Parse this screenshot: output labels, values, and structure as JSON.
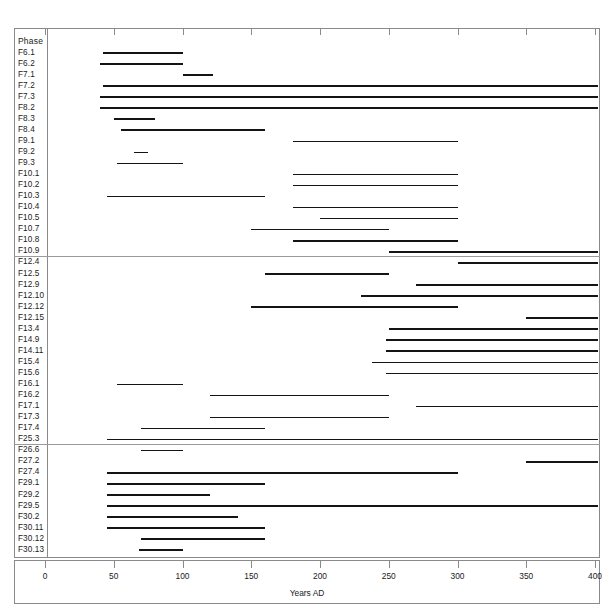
{
  "header": {
    "column_title": "Phase",
    "corner_note": ""
  },
  "axis": {
    "label": "Years AD",
    "ticks": [
      0,
      50,
      100,
      150,
      200,
      250,
      300,
      350,
      400
    ],
    "min": 0,
    "max": 400
  },
  "chart_data": {
    "type": "bar",
    "title": "",
    "xlabel": "Years AD",
    "ylabel": "Phase",
    "xlim": [
      0,
      400
    ],
    "grid": false,
    "legend": "none",
    "orientation": "horizontal-range",
    "note": "Horizontal span (Gantt-style) chart: each phase is a date range in Years AD.",
    "categories": [
      "F6.1",
      "F6.2",
      "F7.1",
      "F7.2",
      "F7.3",
      "F8.2",
      "F8.3",
      "F8.4",
      "F9.1",
      "F9.2",
      "F9.3",
      "F10.1",
      "F10.2",
      "F10.3",
      "F10.4",
      "F10.5",
      "F10.7",
      "F10.8",
      "F10.9",
      "F12.4",
      "F12.5",
      "F12.9",
      "F12.10",
      "F12.12",
      "F12.15",
      "F13.4",
      "F14.9",
      "F14.11",
      "F15.4",
      "F15.6",
      "F16.1",
      "F16.2",
      "F17.1",
      "F17.3",
      "F17.4",
      "F25.3",
      "F26.6",
      "F27.2",
      "F27.4",
      "F29.1",
      "F29.2",
      "F29.5",
      "F30.2",
      "F30.11",
      "F30.12",
      "F30.13"
    ],
    "ranges": [
      {
        "phase": "F6.1",
        "start": 42,
        "end": 100,
        "group": 1
      },
      {
        "phase": "F6.2",
        "start": 40,
        "end": 100,
        "group": 1
      },
      {
        "phase": "F7.1",
        "start": 100,
        "end": 122,
        "group": 1
      },
      {
        "phase": "F7.2",
        "start": 42,
        "end": 400,
        "group": 1
      },
      {
        "phase": "F7.3",
        "start": 40,
        "end": 400,
        "group": 1
      },
      {
        "phase": "F8.2",
        "start": 40,
        "end": 400,
        "group": 1
      },
      {
        "phase": "F8.3",
        "start": 50,
        "end": 80,
        "group": 1
      },
      {
        "phase": "F8.4",
        "start": 55,
        "end": 160,
        "group": 1
      },
      {
        "phase": "F9.1",
        "start": 180,
        "end": 300,
        "group": 1
      },
      {
        "phase": "F9.2",
        "start": 65,
        "end": 75,
        "group": 1
      },
      {
        "phase": "F9.3",
        "start": 52,
        "end": 100,
        "group": 1
      },
      {
        "phase": "F10.1",
        "start": 180,
        "end": 300,
        "group": 1
      },
      {
        "phase": "F10.2",
        "start": 180,
        "end": 300,
        "group": 1
      },
      {
        "phase": "F10.3",
        "start": 45,
        "end": 160,
        "group": 1
      },
      {
        "phase": "F10.4",
        "start": 180,
        "end": 300,
        "group": 1
      },
      {
        "phase": "F10.5",
        "start": 200,
        "end": 300,
        "group": 1
      },
      {
        "phase": "F10.7",
        "start": 150,
        "end": 250,
        "group": 1
      },
      {
        "phase": "F10.8",
        "start": 180,
        "end": 300,
        "group": 1
      },
      {
        "phase": "F10.9",
        "start": 250,
        "end": 400,
        "group": 1
      },
      {
        "phase": "F12.4",
        "start": 300,
        "end": 400,
        "group": 2
      },
      {
        "phase": "F12.5",
        "start": 160,
        "end": 250,
        "group": 2
      },
      {
        "phase": "F12.9",
        "start": 270,
        "end": 400,
        "group": 2
      },
      {
        "phase": "F12.10",
        "start": 230,
        "end": 400,
        "group": 2
      },
      {
        "phase": "F12.12",
        "start": 150,
        "end": 300,
        "group": 2
      },
      {
        "phase": "F12.15",
        "start": 350,
        "end": 400,
        "group": 2
      },
      {
        "phase": "F13.4",
        "start": 250,
        "end": 400,
        "group": 2
      },
      {
        "phase": "F14.9",
        "start": 248,
        "end": 400,
        "group": 2
      },
      {
        "phase": "F14.11",
        "start": 248,
        "end": 400,
        "group": 2
      },
      {
        "phase": "F15.4",
        "start": 238,
        "end": 400,
        "group": 2
      },
      {
        "phase": "F15.6",
        "start": 248,
        "end": 400,
        "group": 2
      },
      {
        "phase": "F16.1",
        "start": 52,
        "end": 100,
        "group": 2
      },
      {
        "phase": "F16.2",
        "start": 120,
        "end": 250,
        "group": 2
      },
      {
        "phase": "F17.1",
        "start": 270,
        "end": 400,
        "group": 2
      },
      {
        "phase": "F17.3",
        "start": 120,
        "end": 250,
        "group": 2
      },
      {
        "phase": "F17.4",
        "start": 70,
        "end": 160,
        "group": 2
      },
      {
        "phase": "F25.3",
        "start": 45,
        "end": 400,
        "group": 2
      },
      {
        "phase": "F26.6",
        "start": 70,
        "end": 100,
        "group": 3
      },
      {
        "phase": "F27.2",
        "start": 350,
        "end": 400,
        "group": 3
      },
      {
        "phase": "F27.4",
        "start": 45,
        "end": 300,
        "group": 3
      },
      {
        "phase": "F29.1",
        "start": 45,
        "end": 160,
        "group": 3
      },
      {
        "phase": "F29.2",
        "start": 45,
        "end": 120,
        "group": 3
      },
      {
        "phase": "F29.5",
        "start": 45,
        "end": 400,
        "group": 3
      },
      {
        "phase": "F30.2",
        "start": 45,
        "end": 140,
        "group": 3
      },
      {
        "phase": "F30.11",
        "start": 45,
        "end": 160,
        "group": 3
      },
      {
        "phase": "F30.12",
        "start": 70,
        "end": 160,
        "group": 3
      },
      {
        "phase": "F30.13",
        "start": 68,
        "end": 100,
        "group": 3
      }
    ]
  },
  "rows": [
    {
      "label": "F6.1",
      "start": 42,
      "end": 100
    },
    {
      "label": "F6.2",
      "start": 40,
      "end": 100
    },
    {
      "label": "F7.1",
      "start": 100,
      "end": 122
    },
    {
      "label": "F7.2",
      "start": 42,
      "end": 402
    },
    {
      "label": "F7.3",
      "start": 40,
      "end": 402
    },
    {
      "label": "F8.2",
      "start": 40,
      "end": 402
    },
    {
      "label": "F8.3",
      "start": 50,
      "end": 80
    },
    {
      "label": "F8.4",
      "start": 55,
      "end": 160
    },
    {
      "label": "F9.1",
      "start": 180,
      "end": 300
    },
    {
      "label": "F9.2",
      "start": 65,
      "end": 75
    },
    {
      "label": "F9.3",
      "start": 52,
      "end": 100
    },
    {
      "label": "F10.1",
      "start": 180,
      "end": 300
    },
    {
      "label": "F10.2",
      "start": 180,
      "end": 300
    },
    {
      "label": "F10.3",
      "start": 45,
      "end": 160
    },
    {
      "label": "F10.4",
      "start": 180,
      "end": 300
    },
    {
      "label": "F10.5",
      "start": 200,
      "end": 300
    },
    {
      "label": "F10.7",
      "start": 150,
      "end": 250
    },
    {
      "label": "F10.8",
      "start": 180,
      "end": 300
    },
    {
      "label": "F10.9",
      "start": 250,
      "end": 402
    },
    {
      "label": "F12.4",
      "start": 300,
      "end": 402
    },
    {
      "label": "F12.5",
      "start": 160,
      "end": 250
    },
    {
      "label": "F12.9",
      "start": 270,
      "end": 402
    },
    {
      "label": "F12.10",
      "start": 230,
      "end": 402
    },
    {
      "label": "F12.12",
      "start": 150,
      "end": 300
    },
    {
      "label": "F12.15",
      "start": 350,
      "end": 402
    },
    {
      "label": "F13.4",
      "start": 250,
      "end": 402
    },
    {
      "label": "F14.9",
      "start": 248,
      "end": 402
    },
    {
      "label": "F14.11",
      "start": 248,
      "end": 402
    },
    {
      "label": "F15.4",
      "start": 238,
      "end": 402
    },
    {
      "label": "F15.6",
      "start": 248,
      "end": 402
    },
    {
      "label": "F16.1",
      "start": 52,
      "end": 100
    },
    {
      "label": "F16.2",
      "start": 120,
      "end": 250
    },
    {
      "label": "F17.1",
      "start": 270,
      "end": 402
    },
    {
      "label": "F17.3",
      "start": 120,
      "end": 250
    },
    {
      "label": "F17.4",
      "start": 70,
      "end": 160
    },
    {
      "label": "F25.3",
      "start": 45,
      "end": 402
    },
    {
      "label": "F26.6",
      "start": 70,
      "end": 100
    },
    {
      "label": "F27.2",
      "start": 350,
      "end": 402
    },
    {
      "label": "F27.4",
      "start": 45,
      "end": 300
    },
    {
      "label": "F29.1",
      "start": 45,
      "end": 160
    },
    {
      "label": "F29.2",
      "start": 45,
      "end": 120
    },
    {
      "label": "F29.5",
      "start": 45,
      "end": 402
    },
    {
      "label": "F30.2",
      "start": 45,
      "end": 140
    },
    {
      "label": "F30.11",
      "start": 45,
      "end": 160
    },
    {
      "label": "F30.12",
      "start": 70,
      "end": 160
    },
    {
      "label": "F30.13",
      "start": 68,
      "end": 100
    }
  ],
  "group_breaks": [
    19,
    36
  ],
  "colors": {
    "bar": "#141414",
    "frame": "#8a8a8a",
    "text": "#1a1a1a"
  }
}
